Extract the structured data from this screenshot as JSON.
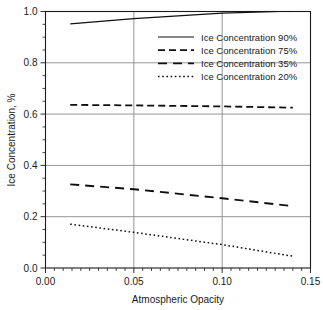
{
  "chart_data": {
    "type": "line",
    "title": "",
    "xlabel": "Atmospheric Opacity",
    "ylabel": "Ice Concentration, %",
    "xlim": [
      0.0,
      0.15
    ],
    "ylim": [
      0.0,
      1.0
    ],
    "xticks": [
      "0.00",
      "0.05",
      "0.10",
      "0.15"
    ],
    "xtick_values": [
      0.0,
      0.05,
      0.1,
      0.15
    ],
    "yticks": [
      "0.0",
      "0.2",
      "0.4",
      "0.6",
      "0.8",
      "1.0"
    ],
    "ytick_values": [
      0.0,
      0.2,
      0.4,
      0.6,
      0.8,
      1.0
    ],
    "grid": "horizontal-and-vertical-major",
    "minor_ticks": true,
    "legend_position": "upper-right-inside",
    "series": [
      {
        "name": "Ice Concentration 90%",
        "style": "solid",
        "x": [
          0.014,
          0.05,
          0.1,
          0.133,
          0.14
        ],
        "values": [
          0.952,
          0.972,
          0.994,
          1.0,
          1.0
        ]
      },
      {
        "name": "Ice Concentration 75%",
        "style": "dashed",
        "x": [
          0.014,
          0.05,
          0.1,
          0.14
        ],
        "values": [
          0.636,
          0.634,
          0.63,
          0.625
        ]
      },
      {
        "name": "Ice Concentration 35%",
        "style": "longdash",
        "x": [
          0.014,
          0.05,
          0.1,
          0.14
        ],
        "values": [
          0.326,
          0.307,
          0.272,
          0.241
        ]
      },
      {
        "name": "Ice Concentration 20%",
        "style": "dotted",
        "x": [
          0.014,
          0.05,
          0.1,
          0.14
        ],
        "values": [
          0.171,
          0.139,
          0.091,
          0.046
        ]
      }
    ]
  },
  "legend": {
    "entries": [
      {
        "label": "Ice Concentration 90%"
      },
      {
        "label": "Ice Concentration 75%"
      },
      {
        "label": "Ice Concentration 35%"
      },
      {
        "label": "Ice Concentration 20%"
      }
    ]
  },
  "colors": {
    "axis": "#1a1a1a",
    "grid": "#8a8a8a",
    "series": "#101010",
    "background": "#ffffff"
  }
}
